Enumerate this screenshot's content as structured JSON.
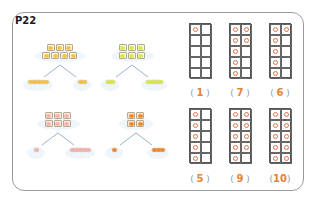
{
  "page": {
    "label": "P22"
  },
  "number_bonds": [
    {
      "name": "bananas",
      "total": 7,
      "rows": [
        3,
        4
      ],
      "parts": [
        5,
        2
      ],
      "color": "#f2c14e",
      "cell_bg": "#fff7dc"
    },
    {
      "name": "lemons",
      "total": 6,
      "rows": [
        3,
        3
      ],
      "parts": [
        2,
        4
      ],
      "color": "#d9e84a",
      "cell_bg": "#f4fbe0"
    },
    {
      "name": "peaches",
      "total": 6,
      "rows": [
        3,
        3
      ],
      "parts": [
        1,
        5
      ],
      "color": "#f4b2a8",
      "cell_bg": "#fdeae6"
    },
    {
      "name": "oranges",
      "total": 4,
      "rows": [
        2,
        2
      ],
      "parts": [
        1,
        3
      ],
      "color": "#ef8a2c",
      "cell_bg": "#fde6d4"
    }
  ],
  "ten_frames": [
    {
      "count": 1,
      "label_open": "(",
      "answer": "1",
      "label_close": ")"
    },
    {
      "count": 7,
      "label_open": "(",
      "answer": "7",
      "label_close": ")"
    },
    {
      "count": 6,
      "label_open": "(",
      "answer": "6",
      "label_close": ")"
    },
    {
      "count": 5,
      "label_open": "(",
      "answer": "5",
      "label_close": ")"
    },
    {
      "count": 9,
      "label_open": "(",
      "answer": "9",
      "label_close": ")"
    },
    {
      "count": 10,
      "label_open": "(",
      "answer": "10",
      "label_close": ")"
    }
  ],
  "colors": {
    "dot": "#e2704a",
    "answer": "#e8823a",
    "bond_line": "#9bb3cc",
    "frame_border": "#9a9a9a"
  }
}
